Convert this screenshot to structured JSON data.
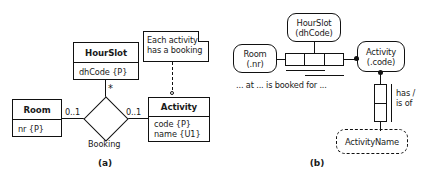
{
  "figure": {
    "caption_a": "(a)",
    "caption_b": "(b)"
  },
  "diagram_a": {
    "type": "er-uml-class-diagram",
    "entities": [
      {
        "name": "Room",
        "attributes": [
          "nr {P}"
        ]
      },
      {
        "name": "HourSlot",
        "attributes": [
          "dhCode {P}"
        ]
      },
      {
        "name": "Activity",
        "attributes": [
          "code {P}",
          "name {U1}"
        ]
      }
    ],
    "relationship": {
      "name": "Booking",
      "shape": "diamond",
      "multiplicities": {
        "room_end": "0..1",
        "hourslot_end": "*",
        "activity_end": "0..1"
      }
    },
    "note": {
      "text_line1": "Each activity",
      "text_line2": "has a booking",
      "attached_to": "Activity"
    }
  },
  "diagram_b": {
    "type": "orm-fact-diagram",
    "object_types": [
      {
        "name": "Room",
        "reference": "(.nr)",
        "kind": "entity"
      },
      {
        "name": "HourSlot",
        "reference": "(dhCode)",
        "kind": "entity"
      },
      {
        "name": "Activity",
        "reference": "(.code)",
        "kind": "entity"
      },
      {
        "name": "ActivityName",
        "reference": "",
        "kind": "value-dashed"
      }
    ],
    "fact_types": [
      {
        "id": "booking",
        "arity": 3,
        "predicate_reading": "... at ... is booked for ...",
        "roles": [
          "Room",
          "HourSlot",
          "Activity"
        ],
        "uniqueness_bars": 2
      },
      {
        "id": "activity-name",
        "arity": 2,
        "predicate_reading_line1": "has",
        "predicate_reading_line2": "/ is of",
        "roles": [
          "Activity",
          "ActivityName"
        ],
        "uniqueness_bars": 2
      }
    ]
  }
}
